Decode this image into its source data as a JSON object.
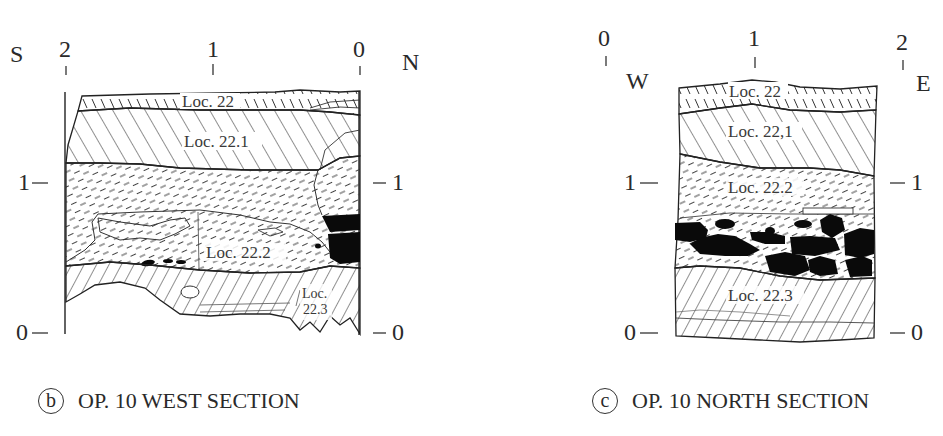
{
  "figures": [
    {
      "id": "b",
      "caption_letter": "b",
      "caption_text": "OP. 10 WEST SECTION",
      "direction_left": "S",
      "direction_right": "N",
      "top_ticks": [
        "2",
        "1",
        "0"
      ],
      "left_ticks": [
        "1",
        "0"
      ],
      "right_ticks": [
        "1",
        "0"
      ],
      "layers": [
        {
          "label": "Loc. 22",
          "pattern": "short-hatch"
        },
        {
          "label": "Loc. 22.1",
          "pattern": "diagonal-hatch"
        },
        {
          "label": "Loc. 22.2",
          "pattern": "dashed-hatch"
        },
        {
          "label": "Loc.",
          "label2": "22.3",
          "pattern": "back-diagonal-hatch"
        }
      ]
    },
    {
      "id": "c",
      "caption_letter": "c",
      "caption_text": "OP. 10 NORTH SECTION",
      "direction_left": "W",
      "direction_right": "E",
      "top_ticks": [
        "0",
        "1",
        "2"
      ],
      "left_ticks": [
        "1",
        "0"
      ],
      "right_ticks": [
        "1",
        "0"
      ],
      "layers": [
        {
          "label": "Loc. 22",
          "pattern": "short-hatch"
        },
        {
          "label": "Loc. 22,1",
          "pattern": "diagonal-hatch"
        },
        {
          "label": "Loc. 22.2",
          "pattern": "dashed-hatch"
        },
        {
          "label": "Loc. 22.3",
          "pattern": "back-diagonal-hatch"
        }
      ]
    }
  ]
}
